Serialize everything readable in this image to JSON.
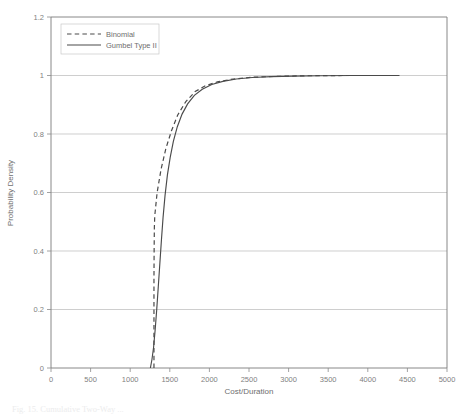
{
  "figure": {
    "caption": "Fig. 15. Cumulative Two-Way ..."
  },
  "chart_data": {
    "type": "line",
    "title": "",
    "xlabel": "Cost/Duration",
    "ylabel": "Probability Density",
    "xlim": [
      0,
      5000
    ],
    "ylim": [
      0,
      1.2
    ],
    "xticks": [
      0,
      500,
      1000,
      1500,
      2000,
      2500,
      3000,
      3500,
      4000,
      4500,
      5000
    ],
    "xtick_labels": [
      "0",
      "500",
      "1000",
      "1500",
      "2000",
      "2500",
      "3000",
      "3500",
      "4000",
      "4500",
      "5000"
    ],
    "yticks": [
      0,
      0.2,
      0.4,
      0.6,
      0.8,
      1,
      1.2
    ],
    "ytick_labels": [
      "0",
      "0.2",
      "0.4",
      "0.6",
      "0.8",
      "1",
      "1.2"
    ],
    "grid": "horizontal",
    "legend_position": "top-left-inside",
    "series": [
      {
        "name": "Binomial",
        "style": "dashed",
        "color": "#4a4a4a",
        "points": [
          [
            1300,
            0.0
          ],
          [
            1300,
            0.1
          ],
          [
            1300,
            0.2
          ],
          [
            1300,
            0.3
          ],
          [
            1302,
            0.4
          ],
          [
            1305,
            0.48
          ],
          [
            1310,
            0.52
          ],
          [
            1340,
            0.6
          ],
          [
            1390,
            0.68
          ],
          [
            1450,
            0.75
          ],
          [
            1520,
            0.81
          ],
          [
            1600,
            0.865
          ],
          [
            1700,
            0.91
          ],
          [
            1820,
            0.945
          ],
          [
            1950,
            0.965
          ],
          [
            2100,
            0.978
          ],
          [
            2300,
            0.988
          ],
          [
            2550,
            0.994
          ],
          [
            2850,
            0.997
          ],
          [
            3200,
            0.999
          ],
          [
            3700,
            1.0
          ],
          [
            4400,
            1.0
          ]
        ]
      },
      {
        "name": "Gumbel Type II",
        "style": "solid",
        "color": "#4a4a4a",
        "points": [
          [
            1255,
            0.0
          ],
          [
            1275,
            0.03
          ],
          [
            1295,
            0.07
          ],
          [
            1315,
            0.13
          ],
          [
            1335,
            0.2
          ],
          [
            1355,
            0.28
          ],
          [
            1375,
            0.36
          ],
          [
            1395,
            0.44
          ],
          [
            1415,
            0.515
          ],
          [
            1440,
            0.59
          ],
          [
            1470,
            0.66
          ],
          [
            1505,
            0.72
          ],
          [
            1545,
            0.775
          ],
          [
            1595,
            0.825
          ],
          [
            1655,
            0.868
          ],
          [
            1725,
            0.903
          ],
          [
            1810,
            0.932
          ],
          [
            1910,
            0.953
          ],
          [
            2030,
            0.969
          ],
          [
            2170,
            0.98
          ],
          [
            2340,
            0.988
          ],
          [
            2540,
            0.993
          ],
          [
            2780,
            0.996
          ],
          [
            3060,
            0.998
          ],
          [
            3400,
            0.999
          ],
          [
            3800,
            1.0
          ],
          [
            4400,
            1.0
          ]
        ]
      }
    ]
  }
}
